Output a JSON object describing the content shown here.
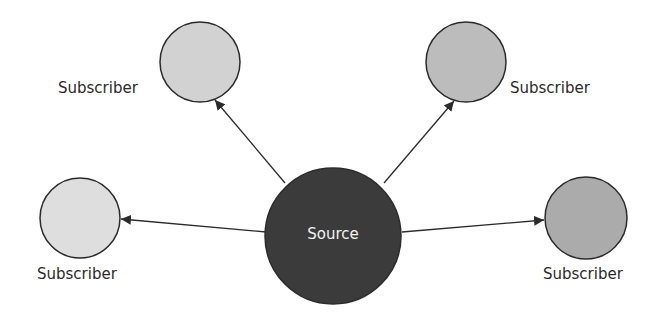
{
  "diagram": {
    "type": "publish-subscribe",
    "source": {
      "label": "Source",
      "cx": 333,
      "cy": 236,
      "r": 68,
      "fill": "#3b3b3b"
    },
    "subscribers": [
      {
        "label": "Subscriber",
        "position": "top-left",
        "cx": 200,
        "cy": 62,
        "r": 40,
        "fill": "#d2d2d2"
      },
      {
        "label": "Subscriber",
        "position": "top-right",
        "cx": 466,
        "cy": 62,
        "r": 40,
        "fill": "#bcbcbc"
      },
      {
        "label": "Subscriber",
        "position": "left",
        "cx": 80,
        "cy": 218,
        "r": 40,
        "fill": "#dedede"
      },
      {
        "label": "Subscriber",
        "position": "right",
        "cx": 586,
        "cy": 218,
        "r": 41,
        "fill": "#ababab"
      }
    ],
    "edges": [
      {
        "from": "source",
        "to": "subscriber-top-left",
        "direction": "source-to-subscriber"
      },
      {
        "from": "source",
        "to": "subscriber-top-right",
        "direction": "source-to-subscriber"
      },
      {
        "from": "source",
        "to": "subscriber-left",
        "direction": "source-to-subscriber"
      },
      {
        "from": "source",
        "to": "subscriber-right",
        "direction": "source-to-subscriber"
      }
    ],
    "colors": {
      "stroke": "#2b2b2b",
      "background": "#ffffff"
    }
  }
}
